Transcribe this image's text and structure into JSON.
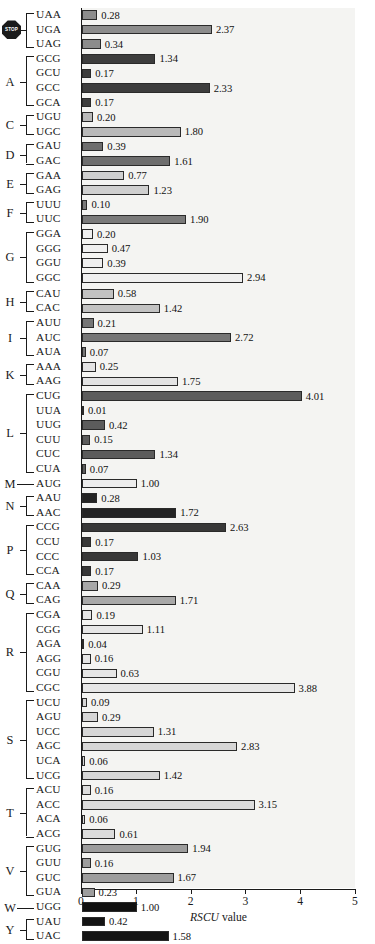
{
  "chart_data": {
    "type": "bar",
    "orientation": "horizontal",
    "title": "",
    "xlabel": "RSCU value",
    "ylabel": "",
    "xlim": [
      0,
      5
    ],
    "xticks": [
      0,
      1,
      2,
      3,
      4,
      5
    ],
    "xtick_labels": [
      "0",
      "1",
      "2",
      "3",
      "4",
      "5"
    ],
    "grid": false,
    "legend": null,
    "categories": [
      "UAA",
      "UGA",
      "UAG",
      "GCG",
      "GCU",
      "GCC",
      "GCA",
      "UGU",
      "UGC",
      "GAU",
      "GAC",
      "GAA",
      "GAG",
      "UUU",
      "UUC",
      "GGA",
      "GGG",
      "GGU",
      "GGC",
      "CAU",
      "CAC",
      "AUU",
      "AUC",
      "AUA",
      "AAA",
      "AAG",
      "CUG",
      "UUA",
      "UUG",
      "CUU",
      "CUC",
      "CUA",
      "AUG",
      "AAU",
      "AAC",
      "CCG",
      "CCU",
      "CCC",
      "CCA",
      "CAA",
      "CAG",
      "CGA",
      "CGG",
      "AGA",
      "AGG",
      "CGU",
      "CGC",
      "UCU",
      "AGU",
      "UCC",
      "AGC",
      "UCA",
      "UCG",
      "ACU",
      "ACC",
      "ACA",
      "ACG",
      "GUG",
      "GUU",
      "GUC",
      "GUA",
      "UGG",
      "UAU",
      "UAC"
    ],
    "values": [
      0.28,
      2.37,
      0.34,
      1.34,
      0.17,
      2.33,
      0.17,
      0.2,
      1.8,
      0.39,
      1.61,
      0.77,
      1.23,
      0.1,
      1.9,
      0.2,
      0.47,
      0.39,
      2.94,
      0.58,
      1.42,
      0.21,
      2.72,
      0.07,
      0.25,
      1.75,
      4.01,
      0.01,
      0.42,
      0.15,
      1.34,
      0.07,
      1.0,
      0.28,
      1.72,
      2.63,
      0.17,
      1.03,
      0.17,
      0.29,
      1.71,
      0.19,
      1.11,
      0.04,
      0.16,
      0.63,
      3.88,
      0.09,
      0.29,
      1.31,
      2.83,
      0.06,
      1.42,
      0.16,
      3.15,
      0.06,
      0.61,
      1.94,
      0.16,
      1.67,
      0.23,
      1.0,
      0.42,
      1.58
    ],
    "value_labels": [
      "0.28",
      "2.37",
      "0.34",
      "1.34",
      "0.17",
      "2.33",
      "0.17",
      "0.20",
      "1.80",
      "0.39",
      "1.61",
      "0.77",
      "1.23",
      "0.10",
      "1.90",
      "0.20",
      "0.47",
      "0.39",
      "2.94",
      "0.58",
      "1.42",
      "0.21",
      "2.72",
      "0.07",
      "0.25",
      "1.75",
      "4.01",
      "0.01",
      "0.42",
      "0.15",
      "1.34",
      "0.07",
      "1.00",
      "0.28",
      "1.72",
      "2.63",
      "0.17",
      "1.03",
      "0.17",
      "0.29",
      "1.71",
      "0.19",
      "1.11",
      "0.04",
      "0.16",
      "0.63",
      "3.88",
      "0.09",
      "0.29",
      "1.31",
      "2.83",
      "0.06",
      "1.42",
      "0.16",
      "3.15",
      "0.06",
      "0.61",
      "1.94",
      "0.16",
      "1.67",
      "0.23",
      "1.00",
      "0.42",
      "1.58"
    ],
    "groups": [
      {
        "letter": "",
        "icon": "stop-sign-icon",
        "codons": [
          "UAA",
          "UGA",
          "UAG"
        ],
        "values": [
          0.28,
          2.37,
          0.34
        ],
        "fill": "#8c8c8c"
      },
      {
        "letter": "A",
        "icon": null,
        "codons": [
          "GCG",
          "GCU",
          "GCC",
          "GCA"
        ],
        "values": [
          1.34,
          0.17,
          2.33,
          0.17
        ],
        "fill": "#3d3d3d"
      },
      {
        "letter": "C",
        "icon": null,
        "codons": [
          "UGU",
          "UGC"
        ],
        "values": [
          0.2,
          1.8
        ],
        "fill": "#b9b9b9"
      },
      {
        "letter": "D",
        "icon": null,
        "codons": [
          "GAU",
          "GAC"
        ],
        "values": [
          0.39,
          1.61
        ],
        "fill": "#6e6e6e"
      },
      {
        "letter": "E",
        "icon": null,
        "codons": [
          "GAA",
          "GAG"
        ],
        "values": [
          0.77,
          1.23
        ],
        "fill": "#cfcfcf"
      },
      {
        "letter": "F",
        "icon": null,
        "codons": [
          "UUU",
          "UUC"
        ],
        "values": [
          0.1,
          1.9
        ],
        "fill": "#7a7a7a"
      },
      {
        "letter": "G",
        "icon": null,
        "codons": [
          "GGA",
          "GGG",
          "GGU",
          "GGC"
        ],
        "values": [
          0.2,
          0.47,
          0.39,
          2.94
        ],
        "fill": "#efefef"
      },
      {
        "letter": "H",
        "icon": null,
        "codons": [
          "CAU",
          "CAC"
        ],
        "values": [
          0.58,
          1.42
        ],
        "fill": "#c2c2c2"
      },
      {
        "letter": "I",
        "icon": null,
        "codons": [
          "AUU",
          "AUC",
          "AUA"
        ],
        "values": [
          0.21,
          2.72,
          0.07
        ],
        "fill": "#767676"
      },
      {
        "letter": "K",
        "icon": null,
        "codons": [
          "AAA",
          "AAG"
        ],
        "values": [
          0.25,
          1.75
        ],
        "fill": "#e3e3e3"
      },
      {
        "letter": "L",
        "icon": null,
        "codons": [
          "CUG",
          "UUA",
          "UUG",
          "CUU",
          "CUC",
          "CUA"
        ],
        "values": [
          4.01,
          0.01,
          0.42,
          0.15,
          1.34,
          0.07
        ],
        "fill": "#5c5c5c"
      },
      {
        "letter": "M",
        "icon": null,
        "codons": [
          "AUG"
        ],
        "values": [
          1.0
        ],
        "fill": "#ededed"
      },
      {
        "letter": "N",
        "icon": null,
        "codons": [
          "AAU",
          "AAC"
        ],
        "values": [
          0.28,
          1.72
        ],
        "fill": "#242424"
      },
      {
        "letter": "P",
        "icon": null,
        "codons": [
          "CCG",
          "CCU",
          "CCC",
          "CCA"
        ],
        "values": [
          2.63,
          0.17,
          1.03,
          0.17
        ],
        "fill": "#383838"
      },
      {
        "letter": "Q",
        "icon": null,
        "codons": [
          "CAA",
          "CAG"
        ],
        "values": [
          0.29,
          1.71
        ],
        "fill": "#a8a8a8"
      },
      {
        "letter": "R",
        "icon": null,
        "codons": [
          "CGA",
          "CGG",
          "AGA",
          "AGG",
          "CGU",
          "CGC"
        ],
        "values": [
          0.19,
          1.11,
          0.04,
          0.16,
          0.63,
          3.88
        ],
        "fill": "#e6e6e6"
      },
      {
        "letter": "S",
        "icon": null,
        "codons": [
          "UCU",
          "AGU",
          "UCC",
          "AGC",
          "UCA",
          "UCG"
        ],
        "values": [
          0.09,
          0.29,
          1.31,
          2.83,
          0.06,
          1.42
        ],
        "fill": "#d6d6d6"
      },
      {
        "letter": "T",
        "icon": null,
        "codons": [
          "ACU",
          "ACC",
          "ACA",
          "ACG"
        ],
        "values": [
          0.16,
          3.15,
          0.06,
          0.61
        ],
        "fill": "#dcdcdc"
      },
      {
        "letter": "V",
        "icon": null,
        "codons": [
          "GUG",
          "GUU",
          "GUC",
          "GUA"
        ],
        "values": [
          1.94,
          0.16,
          1.67,
          0.23
        ],
        "fill": "#9d9d9d"
      },
      {
        "letter": "W",
        "icon": null,
        "codons": [
          "UGG"
        ],
        "values": [
          1.0
        ],
        "fill": "#111111"
      },
      {
        "letter": "Y",
        "icon": null,
        "codons": [
          "UAU",
          "UAC"
        ],
        "values": [
          0.42,
          1.58
        ],
        "fill": "#141414"
      }
    ]
  },
  "axis": {
    "title_italic": "RSCU",
    "title_rest": " value",
    "ticks": [
      "0",
      "1",
      "2",
      "3",
      "4",
      "5"
    ]
  },
  "icons": {
    "stop_sign_text": "STOP"
  }
}
